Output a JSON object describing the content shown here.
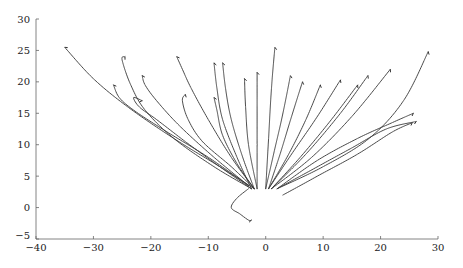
{
  "chart_data": {
    "type": "line",
    "title": "",
    "xlabel": "",
    "ylabel": "",
    "xlim": [
      -40,
      30
    ],
    "ylim": [
      -5,
      30
    ],
    "grid": false,
    "legend": "none",
    "xticks": [
      -40,
      -30,
      -20,
      -10,
      0,
      10,
      20,
      30
    ],
    "yticks": [
      -5,
      0,
      5,
      10,
      15,
      20,
      25,
      30
    ],
    "xtick_labels": [
      "−40",
      "−30",
      "−20",
      "−10",
      "0",
      "10",
      "20",
      "30"
    ],
    "ytick_labels": [
      "−5",
      "0",
      "5",
      "10",
      "15",
      "20",
      "25",
      "30"
    ],
    "series": [
      {
        "name": "traj-1",
        "x": [
          -2,
          -8,
          -16,
          -24,
          -30,
          -35
        ],
        "y": [
          3,
          6.5,
          11,
          16,
          20.5,
          25.5
        ]
      },
      {
        "name": "traj-2",
        "x": [
          -2.5,
          -9,
          -16,
          -21,
          -23.5,
          -25,
          -24.5
        ],
        "y": [
          3,
          6.5,
          11,
          15.5,
          19.5,
          23.5,
          24
        ]
      },
      {
        "name": "traj-3",
        "x": [
          -3,
          -10,
          -18,
          -23,
          -25.5,
          -26.5
        ],
        "y": [
          3.5,
          8,
          12.5,
          15.5,
          17.5,
          19.5
        ]
      },
      {
        "name": "traj-4",
        "x": [
          -3,
          -9,
          -15,
          -19,
          -21,
          -21.5
        ],
        "y": [
          3.5,
          8,
          13,
          17,
          19.5,
          21
        ]
      },
      {
        "name": "traj-5",
        "x": [
          -2.5,
          -8,
          -14,
          -19,
          -22,
          -23,
          -21.5
        ],
        "y": [
          3,
          6.5,
          10.5,
          14,
          16,
          17.5,
          17
        ]
      },
      {
        "name": "traj-6",
        "x": [
          -2,
          -6,
          -10,
          -13,
          -14.5,
          -15.5
        ],
        "y": [
          3,
          8,
          14,
          19,
          22,
          24
        ]
      },
      {
        "name": "traj-7",
        "x": [
          -2,
          -6,
          -11,
          -13.5,
          -14.5,
          -14
        ],
        "y": [
          3,
          6.5,
          10.5,
          14,
          17,
          18
        ]
      },
      {
        "name": "traj-8",
        "x": [
          -2.5,
          -5,
          -7.5,
          -8.5,
          -9
        ],
        "y": [
          3,
          8,
          14,
          19,
          23
        ]
      },
      {
        "name": "traj-9",
        "x": [
          -2,
          -5,
          -7.5,
          -8.5,
          -9
        ],
        "y": [
          3,
          7,
          11.5,
          15.5,
          17.5
        ]
      },
      {
        "name": "traj-10",
        "x": [
          -2,
          -4,
          -6,
          -7,
          -7.5
        ],
        "y": [
          3,
          8,
          14,
          19,
          23
        ]
      },
      {
        "name": "traj-11",
        "x": [
          -1.5,
          -3,
          -3.5,
          -3.7
        ],
        "y": [
          3,
          10,
          16,
          20.5
        ]
      },
      {
        "name": "traj-12",
        "x": [
          -1.5,
          -1.5,
          -1.5,
          -1.5
        ],
        "y": [
          3,
          10,
          16,
          21.5
        ]
      },
      {
        "name": "traj-13",
        "x": [
          0,
          0.5,
          1,
          1.6
        ],
        "y": [
          3,
          11,
          19,
          25.5
        ]
      },
      {
        "name": "traj-14",
        "x": [
          0,
          1.5,
          3,
          4.3
        ],
        "y": [
          3,
          9,
          15,
          21
        ]
      },
      {
        "name": "traj-15",
        "x": [
          0.5,
          2.5,
          4.5,
          6.4
        ],
        "y": [
          3,
          8.5,
          14.5,
          20
        ]
      },
      {
        "name": "traj-16",
        "x": [
          0.5,
          4,
          7,
          9.5
        ],
        "y": [
          3,
          8.5,
          14,
          19.5
        ]
      },
      {
        "name": "traj-17",
        "x": [
          0.5,
          4.5,
          9,
          13
        ],
        "y": [
          3,
          8.5,
          14.5,
          20.3
        ]
      },
      {
        "name": "traj-18",
        "x": [
          1,
          6,
          11,
          16
        ],
        "y": [
          3,
          8,
          13.5,
          19.5
        ]
      },
      {
        "name": "traj-19",
        "x": [
          1,
          7,
          13,
          17.8
        ],
        "y": [
          3,
          8.5,
          15,
          21
        ]
      },
      {
        "name": "traj-20",
        "x": [
          1,
          8,
          15,
          21.7
        ],
        "y": [
          3,
          8,
          14.5,
          22
        ]
      },
      {
        "name": "traj-21",
        "x": [
          2,
          10,
          18,
          24,
          28.3
        ],
        "y": [
          3,
          6.5,
          11,
          17,
          24.8
        ]
      },
      {
        "name": "traj-22",
        "x": [
          2,
          9,
          16,
          22,
          25.7
        ],
        "y": [
          3,
          7.5,
          11,
          13.5,
          15
        ]
      },
      {
        "name": "traj-23",
        "x": [
          2,
          8,
          15,
          21,
          26.2
        ],
        "y": [
          3,
          6,
          9.5,
          12.5,
          13.7
        ]
      },
      {
        "name": "traj-24",
        "x": [
          3,
          9,
          16,
          22,
          25.5
        ],
        "y": [
          2,
          5,
          8.5,
          12,
          13.5
        ]
      },
      {
        "name": "traj-25",
        "x": [
          -3,
          -5,
          -6,
          -4.5,
          -3,
          -2.5
        ],
        "y": [
          3,
          1.5,
          0,
          -1,
          -2,
          -2
        ]
      }
    ]
  }
}
